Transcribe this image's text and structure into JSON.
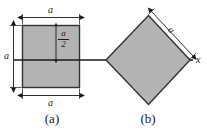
{
  "figure": {
    "colors": {
      "shape_fill": "#b3b3b3",
      "shape_stroke": "#333333",
      "dimension_line": "#1a1a1a",
      "axis_line": "#1a1a1a",
      "background": "#ffffff",
      "text": "#1a1a1a"
    },
    "panels": [
      {
        "id": "a",
        "caption": "(a)",
        "shape": "square-upright",
        "labels": {
          "top_width": "a",
          "left_height": "a",
          "bottom_width": "a",
          "inner_half": {
            "numerator": "a",
            "denominator": "2"
          }
        }
      },
      {
        "id": "b",
        "caption": "(b)",
        "shape": "square-rotated-45",
        "labels": {
          "edge_length": "a",
          "axis": "x"
        }
      }
    ]
  }
}
